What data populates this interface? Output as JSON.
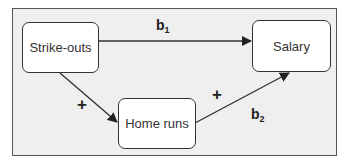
{
  "diagram": {
    "nodes": {
      "strikeouts": "Strike-outs",
      "salary": "Salary",
      "homeruns": "Home runs"
    },
    "edges": [
      {
        "from": "Strike-outs",
        "to": "Salary",
        "label": "b",
        "subscript": "1"
      },
      {
        "from": "Strike-outs",
        "to": "Home runs",
        "sign": "+"
      },
      {
        "from": "Home runs",
        "to": "Salary",
        "sign": "+",
        "label": "b",
        "subscript": "2"
      }
    ],
    "labels": {
      "b1_main": "b",
      "b1_sub": "1",
      "b2_main": "b",
      "b2_sub": "2",
      "plus_left": "+",
      "plus_right": "+"
    },
    "colors": {
      "frame_fill": "#efefef",
      "frame_border": "#555555",
      "node_fill": "#ffffff",
      "line": "#333333"
    }
  }
}
